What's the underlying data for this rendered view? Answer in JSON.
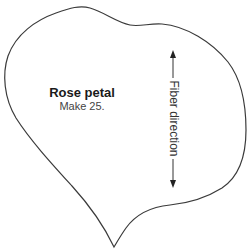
{
  "pattern": {
    "name": "Rose petal",
    "instruction": "Make 25.",
    "grain_label": "Fiber direction"
  },
  "colors": {
    "outline": "#3a3a3a",
    "arrow": "#333333",
    "background": "#ffffff"
  }
}
